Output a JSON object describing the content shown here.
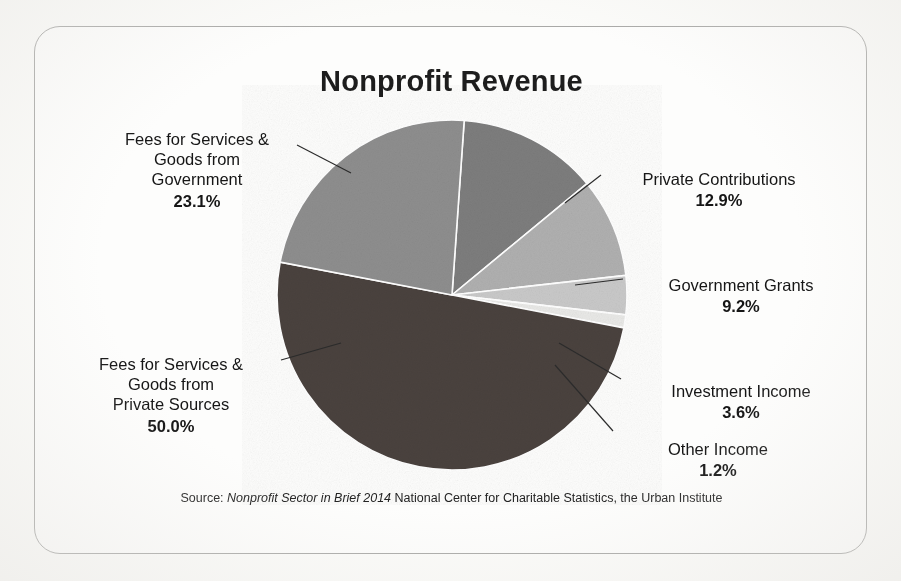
{
  "chart_data": {
    "type": "pie",
    "title": "Nonprofit Revenue",
    "legend_position": "callout-labels",
    "grid": false,
    "categories": [
      "Fees for Services & Goods from Private Sources",
      "Fees for Services & Goods from Government",
      "Private Contributions",
      "Government Grants",
      "Investment Income",
      "Other Income"
    ],
    "values": [
      50.0,
      23.1,
      12.9,
      9.2,
      3.6,
      1.2
    ],
    "value_labels": [
      "50.0%",
      "23.1%",
      "12.9%",
      "9.2%",
      "3.6%",
      "1.2%"
    ],
    "colors": [
      "#4a423e",
      "#8e8e8e",
      "#7d7d7d",
      "#b0b0b0",
      "#c9c9c9",
      "#e9e9e7"
    ],
    "units": "percent",
    "total": 100.0,
    "xlabel": "",
    "ylabel": ""
  },
  "card": {
    "title": "Nonprofit Revenue"
  },
  "slices": [
    {
      "key": "gov_fees",
      "name": "Fees for Services & Goods from Government",
      "label_text": "Fees for Services &\nGoods from\nGovernment",
      "percent": "23.1%",
      "value": 23.1,
      "color": "#8e8e8e"
    },
    {
      "key": "private_fees",
      "name": "Fees for Services & Goods from Private Sources",
      "label_text": "Fees for Services &\nGoods from\nPrivate Sources",
      "percent": "50.0%",
      "value": 50.0,
      "color": "#4a423e"
    },
    {
      "key": "private_contributions",
      "name": "Private Contributions",
      "label_text": "Private Contributions",
      "percent": "12.9%",
      "value": 12.9,
      "color": "#7d7d7d"
    },
    {
      "key": "government_grants",
      "name": "Government Grants",
      "label_text": "Government Grants",
      "percent": "9.2%",
      "value": 9.2,
      "color": "#b0b0b0"
    },
    {
      "key": "investment_income",
      "name": "Investment Income",
      "label_text": "Investment Income",
      "percent": "3.6%",
      "value": 3.6,
      "color": "#c9c9c9"
    },
    {
      "key": "other_income",
      "name": "Other Income",
      "label_text": "Other Income",
      "percent": "1.2%",
      "value": 1.2,
      "color": "#e9e9e7"
    }
  ],
  "source": {
    "prefix": "Source:",
    "publication": "Nonprofit Sector in Brief 2014",
    "suffix": "National Center for Charitable Statistics, the Urban Institute"
  }
}
